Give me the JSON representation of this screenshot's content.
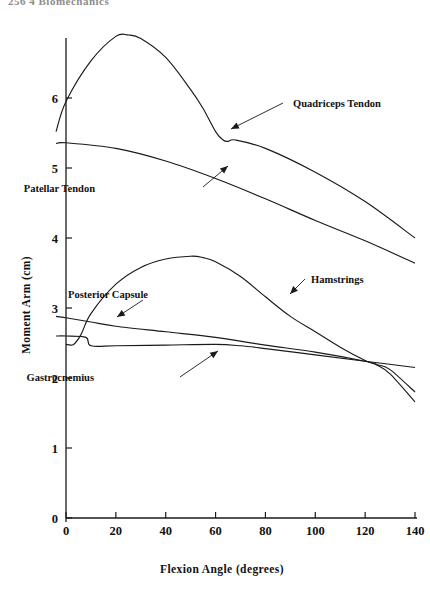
{
  "header": {
    "running_head": "256   4   Biomechanics"
  },
  "chart_data": {
    "type": "line",
    "title": "",
    "xlabel": "Flexion Angle (degrees)",
    "ylabel": "Moment Arm (cm)",
    "xlim": [
      0,
      140
    ],
    "ylim": [
      0,
      7
    ],
    "xticks": [
      0,
      20,
      40,
      60,
      80,
      100,
      120,
      140
    ],
    "yticks": [
      0,
      1,
      2,
      3,
      4,
      5,
      6
    ],
    "xtick_labels": [
      "0",
      "20",
      "40",
      "60",
      "80",
      "100",
      "120",
      "140"
    ],
    "ytick_labels": [
      "0",
      "1",
      "2",
      "3",
      "4",
      "5",
      "6"
    ],
    "grid": false,
    "legend": "annotations",
    "series": [
      {
        "name": "Quadriceps Tendon",
        "x": [
          -4,
          0,
          10,
          20,
          25,
          30,
          40,
          50,
          55,
          60,
          63,
          65,
          68,
          80,
          100,
          120,
          140
        ],
        "values": [
          5.52,
          5.95,
          6.53,
          6.88,
          6.9,
          6.85,
          6.58,
          6.12,
          5.85,
          5.52,
          5.4,
          5.38,
          5.4,
          5.28,
          4.94,
          4.52,
          4.0
        ]
      },
      {
        "name": "Patellar Tendon",
        "x": [
          -4,
          0,
          20,
          40,
          60,
          80,
          100,
          120,
          140
        ],
        "values": [
          5.35,
          5.36,
          5.28,
          5.1,
          4.85,
          4.56,
          4.25,
          3.96,
          3.64
        ]
      },
      {
        "name": "Hamstrings",
        "x": [
          0,
          3,
          6,
          10,
          20,
          30,
          40,
          50,
          55,
          60,
          70,
          80,
          90,
          100,
          110,
          120,
          125,
          130,
          140
        ],
        "values": [
          2.48,
          2.48,
          2.62,
          2.92,
          3.34,
          3.58,
          3.7,
          3.74,
          3.72,
          3.66,
          3.45,
          3.16,
          2.88,
          2.66,
          2.44,
          2.25,
          2.18,
          2.06,
          1.66
        ]
      },
      {
        "name": "Posterior Capsule",
        "x": [
          -4,
          0,
          10,
          20,
          40,
          60,
          80,
          100,
          120,
          125,
          130,
          140
        ],
        "values": [
          2.88,
          2.86,
          2.8,
          2.74,
          2.66,
          2.58,
          2.47,
          2.37,
          2.24,
          2.19,
          2.12,
          1.8
        ]
      },
      {
        "name": "Gastrocnemius",
        "x": [
          -4,
          0,
          8,
          10,
          20,
          40,
          60,
          70,
          80,
          100,
          120,
          140
        ],
        "values": [
          2.6,
          2.6,
          2.58,
          2.46,
          2.46,
          2.47,
          2.48,
          2.46,
          2.42,
          2.33,
          2.24,
          2.15
        ]
      }
    ],
    "annotations": [
      {
        "label": "Quadriceps Tendon",
        "target_x": 66,
        "target_y": 5.4
      },
      {
        "label": "Patellar Tendon",
        "target_x": 56,
        "target_y": 4.92
      },
      {
        "label": "Hamstrings",
        "target_x": 80,
        "target_y": 3.16
      },
      {
        "label": "Posterior Capsule",
        "target_x": 20,
        "target_y": 2.74
      },
      {
        "label": "Gastrocnemius",
        "target_x": 62,
        "target_y": 2.48
      }
    ]
  }
}
